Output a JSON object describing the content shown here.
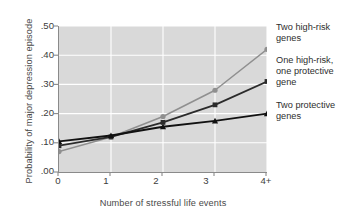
{
  "chart_data": {
    "type": "line",
    "title": "",
    "xlabel": "Number of stressful life events",
    "ylabel": "Probability of major depression episode",
    "categories": [
      "0",
      "1",
      "2",
      "3",
      "4+"
    ],
    "x": [
      0,
      1,
      2,
      3,
      4
    ],
    "xlim": [
      0,
      4
    ],
    "ylim": [
      0.0,
      0.5
    ],
    "ytick_labels": [
      ".00",
      ".10",
      ".20",
      ".30",
      ".40",
      ".50"
    ],
    "ytick_values": [
      0.0,
      0.1,
      0.2,
      0.3,
      0.4,
      0.5
    ],
    "xtick_labels": [
      "0",
      "1",
      "2",
      "3",
      "4+"
    ],
    "grid": "horizontal-and-vertical-white-on-gray",
    "legend_position": "right-outside",
    "series": [
      {
        "name": "Two high-risk genes",
        "values": [
          0.07,
          0.12,
          0.19,
          0.28,
          0.42
        ],
        "color": "#8f8f8f",
        "marker": "circle"
      },
      {
        "name": "One high-risk, one protective gene",
        "values": [
          0.09,
          0.12,
          0.17,
          0.23,
          0.31
        ],
        "color": "#2b2b2b",
        "marker": "square"
      },
      {
        "name": "Two protective genes",
        "values": [
          0.105,
          0.125,
          0.155,
          0.175,
          0.2
        ],
        "color": "#111111",
        "marker": "triangle"
      }
    ]
  },
  "legend": {
    "items": [
      {
        "label_line1": "Two high-risk",
        "label_line2": "genes",
        "label_line3": ""
      },
      {
        "label_line1": "One high-risk,",
        "label_line2": "one protective",
        "label_line3": "gene"
      },
      {
        "label_line1": "Two protective",
        "label_line2": "genes",
        "label_line3": ""
      }
    ]
  },
  "colors": {
    "plot_background": "#d9d9d9",
    "page_background": "#ffffff",
    "gridline": "#ffffff",
    "axis": "#8a8a8a",
    "series_high_risk": "#8f8f8f",
    "series_mixed": "#2b2b2b",
    "series_protective": "#111111"
  }
}
